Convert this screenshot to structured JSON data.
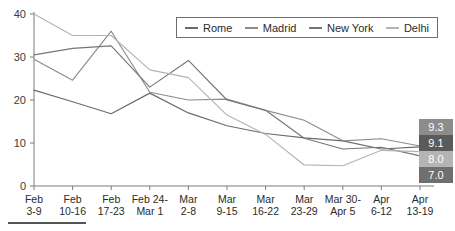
{
  "chart_data": {
    "type": "line",
    "title": "",
    "xlabel": "",
    "ylabel": "",
    "ylim": [
      0,
      40
    ],
    "yticks": [
      0,
      10,
      20,
      30,
      40
    ],
    "grid": false,
    "legend_position": "top-right",
    "categories": [
      "Feb\n3-9",
      "Feb\n10-16",
      "Feb\n17-23",
      "Feb 24-\nMar 1",
      "Mar\n2-8",
      "Mar\n9-15",
      "Mar\n16-22",
      "Mar\n23-29",
      "Mar 30-\nApr 5",
      "Apr\n6-12",
      "Apr\n13-19"
    ],
    "series": [
      {
        "name": "Rome",
        "color": "#6b6b6b",
        "values": [
          22.3,
          19.6,
          16.8,
          21.6,
          17.0,
          14.0,
          12.2,
          11.2,
          10.5,
          8.6,
          9.1
        ],
        "end_label": "9.1"
      },
      {
        "name": "Madrid",
        "color": "#8c8c8c",
        "values": [
          29.5,
          24.6,
          36.0,
          21.8,
          20.0,
          20.2,
          17.6,
          15.3,
          10.5,
          11.0,
          9.3
        ],
        "end_label": "9.3"
      },
      {
        "name": "New York",
        "color": "#767676",
        "values": [
          30.5,
          32.0,
          32.6,
          23.0,
          29.2,
          20.0,
          17.6,
          11.1,
          8.6,
          9.0,
          7.0
        ],
        "end_label": "7.0"
      },
      {
        "name": "Delhi",
        "color": "#b4b4b4",
        "values": [
          40.0,
          35.0,
          35.0,
          27.0,
          25.2,
          16.5,
          12.0,
          4.9,
          4.7,
          8.3,
          8.0
        ],
        "end_label": "8.0"
      }
    ]
  },
  "legend": {
    "items": [
      {
        "label": "Rome",
        "color": "#6b6b6b"
      },
      {
        "label": "Madrid",
        "color": "#8c8c8c"
      },
      {
        "label": "New York",
        "color": "#767676"
      },
      {
        "label": "Delhi",
        "color": "#b4b4b4"
      }
    ]
  },
  "value_badges": [
    {
      "value": "9.3",
      "background": "#8c8c8c"
    },
    {
      "value": "9.1",
      "background": "#5a5a5a"
    },
    {
      "value": "8.0",
      "background": "#b4b4b4"
    },
    {
      "value": "7.0",
      "background": "#6f6f6f"
    }
  ],
  "accent_rule": {
    "color": "#555555"
  }
}
